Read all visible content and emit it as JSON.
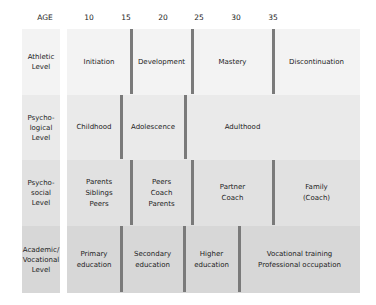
{
  "axis": {
    "label": "AGE",
    "ticks": [
      {
        "label": "10",
        "x": 89
      },
      {
        "label": "15",
        "x": 126
      },
      {
        "label": "20",
        "x": 163
      },
      {
        "label": "25",
        "x": 199
      },
      {
        "label": "30",
        "x": 236
      },
      {
        "label": "35",
        "x": 273
      }
    ]
  },
  "rows": [
    {
      "label": "Athletic\nLevel",
      "top": 29,
      "height": 66,
      "bg": "#f3f3f3",
      "dividers": [
        131,
        192,
        273
      ],
      "segments": [
        {
          "text": "Initiation",
          "x1": 67,
          "x2": 131
        },
        {
          "text": "Development",
          "x1": 131,
          "x2": 192
        },
        {
          "text": "Mastery",
          "x1": 192,
          "x2": 273
        },
        {
          "text": "Discontinuation",
          "x1": 273,
          "x2": 360
        }
      ]
    },
    {
      "label": "Psycho-\nlogical\nLevel",
      "top": 95,
      "height": 65,
      "bg": "#eaeaea",
      "dividers": [
        121,
        185
      ],
      "segments": [
        {
          "text": "Childhood",
          "x1": 67,
          "x2": 121
        },
        {
          "text": "Adolescence",
          "x1": 121,
          "x2": 185
        },
        {
          "text": "Adulthood",
          "x1": 185,
          "x2": 300
        }
      ]
    },
    {
      "label": "Psycho-\nsocial\nLevel",
      "top": 160,
      "height": 66,
      "bg": "#e1e1e1",
      "dividers": [
        131,
        192,
        273
      ],
      "segments": [
        {
          "text": "Parents\nSiblings\nPeers",
          "x1": 67,
          "x2": 131
        },
        {
          "text": "Peers\nCoach\nParents",
          "x1": 131,
          "x2": 192
        },
        {
          "text": "Partner\nCoach",
          "x1": 192,
          "x2": 273
        },
        {
          "text": "Family\n(Coach)",
          "x1": 273,
          "x2": 360
        }
      ]
    },
    {
      "label": "Academic/\nVocational\nLevel",
      "top": 226,
      "height": 67,
      "bg": "#d7d7d7",
      "dividers": [
        121,
        184,
        239
      ],
      "segments": [
        {
          "text": "Primary\neducation",
          "x1": 67,
          "x2": 121
        },
        {
          "text": "Secondary\neducation",
          "x1": 121,
          "x2": 184
        },
        {
          "text": "Higher\neducation",
          "x1": 184,
          "x2": 239
        },
        {
          "text": "Vocational training\nProfessional occupation",
          "x1": 239,
          "x2": 360
        }
      ]
    }
  ],
  "colors": {
    "divider": "#7a7a7a",
    "text": "#222222"
  }
}
